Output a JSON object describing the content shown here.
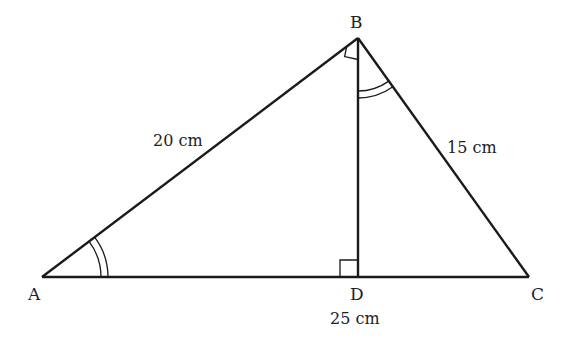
{
  "diagram": {
    "type": "geometry-right-triangle-with-altitude",
    "colors": {
      "stroke": "#1a1a1a",
      "text": "#222222",
      "background": "#ffffff"
    },
    "vertices": {
      "A": {
        "label": "A",
        "x": 42,
        "y": 277
      },
      "B": {
        "label": "B",
        "x": 358,
        "y": 38
      },
      "C": {
        "label": "C",
        "x": 529,
        "y": 277
      },
      "D": {
        "label": "D",
        "x": 358,
        "y": 277
      }
    },
    "segments": [
      {
        "from": "A",
        "to": "B",
        "label": "20 cm"
      },
      {
        "from": "B",
        "to": "C",
        "label": "15 cm"
      },
      {
        "from": "A",
        "to": "C",
        "label": "25 cm"
      },
      {
        "from": "B",
        "to": "D",
        "label": ""
      }
    ],
    "labels": {
      "A": "A",
      "B": "B",
      "C": "C",
      "D": "D",
      "AB": "20 cm",
      "BC": "15 cm",
      "AC": "25 cm"
    },
    "markers": {
      "right_angles": [
        "ABD-at-B",
        "BDA-at-D"
      ],
      "equal_angles": [
        "BAD-at-A (double arc)",
        "DBC-at-B (double arc)"
      ]
    }
  }
}
